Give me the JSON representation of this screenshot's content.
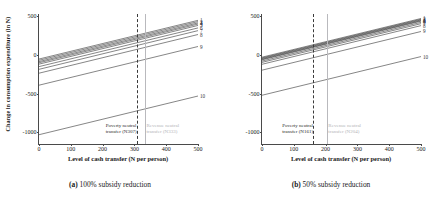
{
  "figure": {
    "panels": [
      {
        "id": "panel-a",
        "caption_tag": "(a)",
        "caption_text": "100% subsidy reduction",
        "poverty_note_line1": "Poverty neutral",
        "poverty_note_line2": "transfer (N307)",
        "revenue_note_line1": "Revenue neutral",
        "revenue_note_line2": "transfer (N333)"
      },
      {
        "id": "panel-b",
        "caption_tag": "(b)",
        "caption_text": "50% subsidy reduction",
        "poverty_note_line1": "Poverty neutral",
        "poverty_note_line2": "transfer (N161)",
        "revenue_note_line1": "Revenue neutral",
        "revenue_note_line2": "transfer (N204)"
      }
    ],
    "axis": {
      "ylabel": "Change in consumption expenditure (in N)",
      "xlabel": "Level of cash transfer (N per person)",
      "yticks": [
        "500",
        "0",
        "-500",
        "-1000"
      ],
      "xticks": [
        "0",
        "100",
        "200",
        "300",
        "400",
        "500"
      ]
    },
    "colors": {
      "line": "#3a3a3a",
      "poverty_neutral_rule": "#3a3a3a",
      "revenue_neutral_rule": "#b9b9bd",
      "frame": "#4a4a4a"
    }
  },
  "chart_data": [
    {
      "type": "line",
      "title": "(a) 100% subsidy reduction",
      "xlabel": "Level of cash transfer (N per person)",
      "ylabel": "Change in consumption expenditure (in N)",
      "xlim": [
        0,
        500
      ],
      "ylim": [
        -1150,
        530
      ],
      "xticks": [
        0,
        100,
        200,
        300,
        400,
        500
      ],
      "yticks": [
        500,
        0,
        -500,
        -1000
      ],
      "grid": false,
      "legend": "right-edge-decile-numbers",
      "x": [
        0,
        500
      ],
      "series": [
        {
          "name": "1",
          "values": [
            -52,
            448
          ]
        },
        {
          "name": "2",
          "values": [
            -68,
            432
          ]
        },
        {
          "name": "3",
          "values": [
            -85,
            415
          ]
        },
        {
          "name": "4",
          "values": [
            -100,
            400
          ]
        },
        {
          "name": "5",
          "values": [
            -118,
            382
          ]
        },
        {
          "name": "6",
          "values": [
            -150,
            350
          ]
        },
        {
          "name": "7",
          "values": [
            -185,
            315
          ]
        },
        {
          "name": "8",
          "values": [
            -235,
            265
          ]
        },
        {
          "name": "9",
          "values": [
            -390,
            110
          ]
        },
        {
          "name": "10",
          "values": [
            -1030,
            -530
          ]
        }
      ],
      "annotations": [
        {
          "type": "vline",
          "x": 307,
          "style": "dashed",
          "label": "Poverty neutral transfer (N307)"
        },
        {
          "type": "vline",
          "x": 333,
          "style": "solid-grey",
          "label": "Revenue neutral transfer (N333)"
        }
      ]
    },
    {
      "type": "line",
      "title": "(b) 50% subsidy reduction",
      "xlabel": "Level of cash transfer (N per person)",
      "ylabel": "Change in consumption expenditure (in N)",
      "xlim": [
        0,
        500
      ],
      "ylim": [
        -1150,
        530
      ],
      "xticks": [
        0,
        100,
        200,
        300,
        400,
        500
      ],
      "yticks": [
        500,
        0,
        -500,
        -1000
      ],
      "grid": false,
      "legend": "right-edge-decile-numbers",
      "x": [
        0,
        500
      ],
      "series": [
        {
          "name": "1",
          "values": [
            -28,
            472
          ]
        },
        {
          "name": "2",
          "values": [
            -38,
            462
          ]
        },
        {
          "name": "3",
          "values": [
            -46,
            454
          ]
        },
        {
          "name": "4",
          "values": [
            -55,
            445
          ]
        },
        {
          "name": "5",
          "values": [
            -62,
            438
          ]
        },
        {
          "name": "6",
          "values": [
            -78,
            422
          ]
        },
        {
          "name": "7",
          "values": [
            -95,
            405
          ]
        },
        {
          "name": "8",
          "values": [
            -120,
            380
          ]
        },
        {
          "name": "9",
          "values": [
            -196,
            304
          ]
        },
        {
          "name": "10",
          "values": [
            -520,
            -20
          ]
        }
      ],
      "annotations": [
        {
          "type": "vline",
          "x": 161,
          "style": "dashed",
          "label": "Poverty neutral transfer (N161)"
        },
        {
          "type": "vline",
          "x": 204,
          "style": "solid-grey",
          "label": "Revenue neutral transfer (N204)"
        }
      ]
    }
  ]
}
